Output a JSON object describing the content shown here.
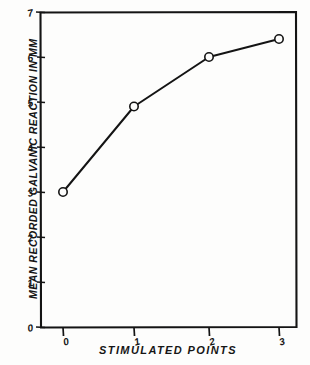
{
  "chart_data": {
    "type": "line",
    "title": "",
    "subtitle": "",
    "xlabel": "STIMULATED POINTS",
    "ylabel": "MEAN RECORDED GALVANIC REACTION IN MM",
    "x": [
      0,
      1,
      2,
      3
    ],
    "values": [
      3.0,
      4.9,
      6.0,
      6.4
    ],
    "categories": [
      "0",
      "1",
      "2",
      "3"
    ],
    "series": [
      {
        "name": "Mean recorded galvanic reaction",
        "values": [
          3.0,
          4.9,
          6.0,
          6.4
        ]
      }
    ],
    "xlim": [
      0,
      3
    ],
    "ylim": [
      0,
      7
    ],
    "x_ticks": [
      "0",
      "1",
      "2",
      "3"
    ],
    "y_ticks": [
      "0",
      "1",
      "2",
      "3",
      "4",
      "5",
      "6",
      "7"
    ],
    "grid": false,
    "legend": "none",
    "marker": "open-circle",
    "line_color": "#141414",
    "marker_color": "#141414",
    "axis_color": "#141414",
    "background_color": "#fdfdfc",
    "annotations": []
  },
  "axes": {
    "x_title": "STIMULATED POINTS",
    "y_title": "MEAN RECORDED GALVANIC REACTION IN MM"
  },
  "ticks": {
    "x": [
      {
        "label": "0",
        "px": 63
      },
      {
        "label": "1",
        "px": 134
      },
      {
        "label": "2",
        "px": 209
      },
      {
        "label": "3",
        "px": 279
      }
    ],
    "y": [
      {
        "label": "0",
        "py": 327
      },
      {
        "label": "1",
        "py": 282
      },
      {
        "label": "2",
        "py": 237
      },
      {
        "label": "3",
        "py": 192
      },
      {
        "label": "4",
        "py": 147
      },
      {
        "label": "5",
        "py": 102
      },
      {
        "label": "6",
        "py": 57
      },
      {
        "label": "7",
        "py": 12
      }
    ]
  }
}
